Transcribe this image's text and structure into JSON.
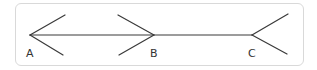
{
  "diagram": {
    "type": "geometry-rays",
    "stroke_color": "#3a3a3a",
    "border_color": "#d9d9d9",
    "points": [
      {
        "label": "A",
        "x": 30,
        "y": 35
      },
      {
        "label": "B",
        "x": 154,
        "y": 35
      },
      {
        "label": "C",
        "x": 252,
        "y": 35
      }
    ],
    "labels": {
      "a": "A",
      "b": "B",
      "c": "C"
    }
  }
}
